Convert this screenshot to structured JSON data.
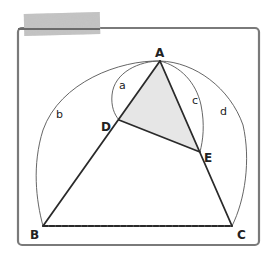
{
  "figure": {
    "type": "geometry-diagram",
    "points": {
      "A": {
        "label": "A",
        "x": 160,
        "y": 61
      },
      "B": {
        "label": "B",
        "x": 43,
        "y": 226
      },
      "C": {
        "label": "C",
        "x": 232,
        "y": 226
      },
      "D": {
        "label": "D",
        "x": 119,
        "y": 120
      },
      "E": {
        "label": "E",
        "x": 200,
        "y": 152
      }
    },
    "segments": [
      "AB",
      "AC",
      "BC",
      "DE",
      "AD",
      "AE"
    ],
    "shaded_region": "triangle ADE",
    "arcs": {
      "a": {
        "label": "a",
        "from": "A",
        "to": "D"
      },
      "b": {
        "label": "b",
        "from": "A",
        "to": "B"
      },
      "c": {
        "label": "c",
        "from": "A",
        "to": "E"
      },
      "d": {
        "label": "d",
        "from": "A",
        "to": "C"
      }
    },
    "colors": {
      "frame": "#7a7a7a",
      "edges": "#2a2a2a",
      "arcs": "#555555",
      "shade": "#e6e6e6",
      "tape": "#b5b5b5"
    }
  }
}
